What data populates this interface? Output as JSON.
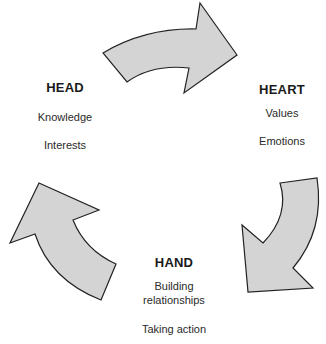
{
  "diagram": {
    "type": "cycle",
    "colors": {
      "arrow_fill": "#d4d4d4",
      "arrow_stroke": "#222222",
      "text": "#1a1a1a"
    },
    "nodes": [
      {
        "id": "head",
        "title": "HEAD",
        "items": [
          "Knowledge",
          "Interests"
        ]
      },
      {
        "id": "heart",
        "title": "HEART",
        "items": [
          "Values",
          "Emotions"
        ]
      },
      {
        "id": "hand",
        "title": "HAND",
        "items": [
          "Building relationships",
          "Taking action"
        ],
        "item_lines": [
          [
            "Building",
            "relationships"
          ],
          [
            "Taking action"
          ]
        ]
      }
    ],
    "arrows": [
      {
        "from": "head",
        "to": "heart",
        "direction": "clockwise"
      },
      {
        "from": "heart",
        "to": "hand",
        "direction": "clockwise"
      },
      {
        "from": "hand",
        "to": "head",
        "direction": "clockwise"
      }
    ]
  }
}
